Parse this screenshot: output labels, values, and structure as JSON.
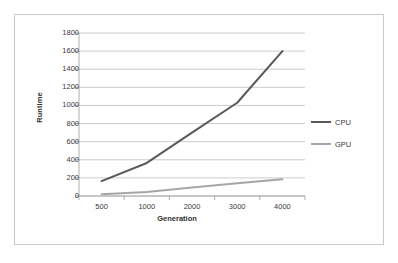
{
  "chart_data": {
    "type": "line",
    "title": "",
    "xlabel": "Generation",
    "ylabel": "Runtime",
    "categories": [
      "500",
      "1000",
      "2000",
      "3000",
      "4000"
    ],
    "x_tick_labels": [
      "500",
      "1000",
      "2000",
      "3000",
      "4000"
    ],
    "y_tick_labels": [
      "0",
      "200",
      "400",
      "600",
      "800",
      "1000",
      "1200",
      "1400",
      "1600",
      "1800"
    ],
    "ylim": [
      0,
      1800
    ],
    "y_tick_step": 200,
    "grid": "horizontal",
    "legend_position": "right",
    "series": [
      {
        "name": "CPU",
        "color": "#595959",
        "values": [
          165,
          365,
          700,
          1030,
          1600
        ]
      },
      {
        "name": "GPU",
        "color": "#a6a6a6",
        "values": [
          20,
          45,
          95,
          140,
          185
        ]
      }
    ]
  },
  "chart": {
    "y_axis_title": "Runtime",
    "x_axis_title": "Generation",
    "legend": [
      {
        "label": "CPU",
        "color": "#595959"
      },
      {
        "label": "GPU",
        "color": "#a6a6a6"
      }
    ]
  },
  "colors": {
    "frame_border": "#c9c9c9",
    "gridline": "#bfbfbf",
    "axis": "#9a9a9a",
    "background": "#ffffff",
    "text": "#3a3a3a"
  }
}
